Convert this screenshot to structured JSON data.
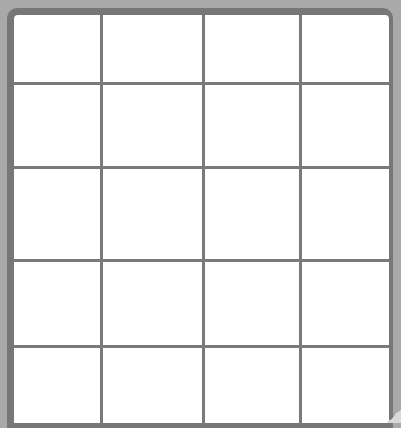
{
  "grid": {
    "columns": 4,
    "rows": 5,
    "cells": [
      [
        "",
        "",
        "",
        ""
      ],
      [
        "",
        "",
        "",
        ""
      ],
      [
        "",
        "",
        "",
        ""
      ],
      [
        "",
        "",
        "",
        ""
      ],
      [
        "",
        "",
        "",
        ""
      ]
    ],
    "colors": {
      "background": "#a9a9a9",
      "frame": "#777777",
      "lines": "#7a7a7a",
      "cell": "#ffffff"
    }
  }
}
